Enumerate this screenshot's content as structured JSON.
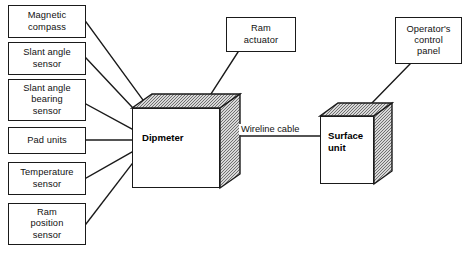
{
  "diagram": {
    "colors": {
      "line": "#1a1a1a",
      "box_fill": "#ffffff",
      "cube_shade": "#a8a8a8",
      "background": "#ffffff"
    },
    "nodes": [
      {
        "id": "magnetic-compass",
        "name": "magnetic-compass-box",
        "lines": [
          "Magnetic",
          "compass"
        ],
        "x": 8,
        "y": 5,
        "w": 78,
        "h": 33
      },
      {
        "id": "slant-angle-sensor",
        "name": "slant-angle-sensor-box",
        "lines": [
          "Slant angle",
          "sensor"
        ],
        "x": 8,
        "y": 42,
        "w": 78,
        "h": 33
      },
      {
        "id": "slant-angle-bearing-sensor",
        "name": "slant-angle-bearing-sensor-box",
        "lines": [
          "Slant angle",
          "bearing",
          "sensor"
        ],
        "x": 8,
        "y": 79,
        "w": 78,
        "h": 42
      },
      {
        "id": "pad-units",
        "name": "pad-units-box",
        "lines": [
          "Pad units"
        ],
        "x": 8,
        "y": 127,
        "w": 78,
        "h": 27
      },
      {
        "id": "temperature-sensor",
        "name": "temperature-sensor-box",
        "lines": [
          "Temperature",
          "sensor"
        ],
        "x": 8,
        "y": 162,
        "w": 78,
        "h": 33
      },
      {
        "id": "ram-position-sensor",
        "name": "ram-position-sensor-box",
        "lines": [
          "Ram",
          "position",
          "sensor"
        ],
        "x": 8,
        "y": 203,
        "w": 78,
        "h": 42
      },
      {
        "id": "ram-actuator",
        "name": "ram-actuator-box",
        "lines": [
          "Ram",
          "actuator"
        ],
        "x": 226,
        "y": 17,
        "w": 70,
        "h": 35
      },
      {
        "id": "operators-control-panel",
        "name": "operators-control-panel-box",
        "lines": [
          "Operator's",
          "control",
          "panel"
        ],
        "x": 395,
        "y": 17,
        "w": 67,
        "h": 47
      }
    ],
    "cubes": [
      {
        "id": "dipmeter",
        "name": "dipmeter-cube",
        "label": "Dipmeter",
        "x": 132,
        "y": 94,
        "w": 88,
        "h": 80,
        "depth_x": 20,
        "depth_y": 14,
        "label_x": 10,
        "label_y": 24
      },
      {
        "id": "surface-unit",
        "name": "surface-unit-cube",
        "label_lines": [
          "Surface",
          "unit"
        ],
        "label": "Surface unit",
        "x": 320,
        "y": 103,
        "w": 54,
        "h": 68,
        "depth_x": 18,
        "depth_y": 13,
        "label_x": 8,
        "label_y": 14
      }
    ],
    "edge_labels": [
      {
        "id": "wireline-cable",
        "name": "wireline-cable-label",
        "text": "Wireline cable",
        "x": 239,
        "y": 124
      }
    ],
    "connectors": [
      {
        "id": "magnetic-compass-to-dipmeter",
        "points": "86,22 143,100"
      },
      {
        "id": "slant-angle-sensor-to-dipmeter",
        "points": "86,58 132,107"
      },
      {
        "id": "slant-angle-bearing-sensor-to-dipmeter",
        "points": "86,104 132,129"
      },
      {
        "id": "pad-units-to-dipmeter",
        "points": "86,140 132,140"
      },
      {
        "id": "temperature-sensor-to-dipmeter",
        "points": "86,178 132,152"
      },
      {
        "id": "ram-position-sensor-to-dipmeter",
        "points": "86,224 132,164"
      },
      {
        "id": "ram-actuator-to-dipmeter",
        "points": "238,52 209,97"
      },
      {
        "id": "dipmeter-to-surface-unit",
        "points": "241,136 320,136"
      },
      {
        "id": "operators-control-panel-to-surface-unit",
        "points": "410,64 371,104"
      }
    ]
  }
}
